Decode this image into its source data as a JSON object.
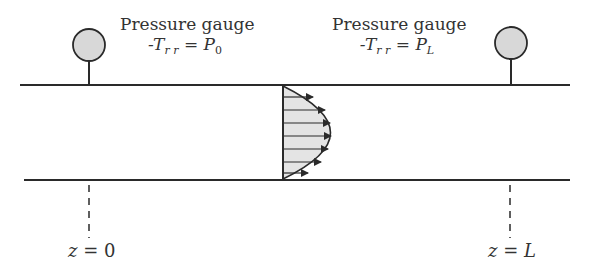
{
  "diagram": {
    "type": "pipe-flow-schematic",
    "gauges": [
      {
        "title": "Pressure gauge",
        "eq_prefix": "-T",
        "eq_sub": "r r",
        "eq_mid": " = ",
        "eq_var": "P",
        "eq_var_sub": "0"
      },
      {
        "title": "Pressure gauge",
        "eq_prefix": "-T",
        "eq_sub": "r r",
        "eq_mid": " = ",
        "eq_var": "P",
        "eq_var_sub": "L"
      }
    ],
    "positions": [
      {
        "label_var": "z",
        "label_eq": " = ",
        "label_val": "0"
      },
      {
        "label_var": "z",
        "label_eq": " = ",
        "label_val": "L"
      }
    ],
    "velocity_profile": {
      "shape": "parabolic",
      "arrow_count": 7
    },
    "colors": {
      "line": "#2a2a2a",
      "gauge_fill": "#d8d8d8",
      "profile_fill": "#e4e4e4"
    }
  }
}
